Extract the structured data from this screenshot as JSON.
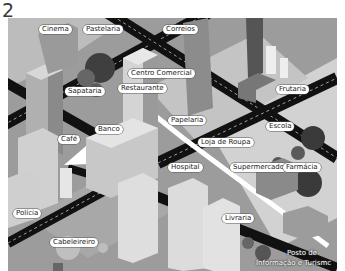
{
  "figure": {
    "number": "2"
  },
  "map": {
    "style": "isometric city illustration, grayscale",
    "colors": {
      "ground": "#9a9a9a",
      "light_block": "#cfcfcf",
      "road": "#111111",
      "route_arrow": "#ffffff"
    },
    "labels": [
      {
        "id": "cinema",
        "text": "Cinema"
      },
      {
        "id": "pastelaria",
        "text": "Pastelaria"
      },
      {
        "id": "correios",
        "text": "Correios"
      },
      {
        "id": "centro-comercial",
        "text": "Centro Comercial"
      },
      {
        "id": "sapataria",
        "text": "Sapataria"
      },
      {
        "id": "restaurante",
        "text": "Restaurante"
      },
      {
        "id": "frutaria",
        "text": "Frutaria"
      },
      {
        "id": "papelaria",
        "text": "Papelaria"
      },
      {
        "id": "cafe",
        "text": "Café"
      },
      {
        "id": "banco",
        "text": "Banco"
      },
      {
        "id": "loja-de-roupa",
        "text": "Loja de Roupa"
      },
      {
        "id": "escola",
        "text": "Escola"
      },
      {
        "id": "hospital",
        "text": "Hospital"
      },
      {
        "id": "supermercado",
        "text": "Supermercado"
      },
      {
        "id": "farmacia",
        "text": "Farmácia"
      },
      {
        "id": "livraria",
        "text": "Livraria"
      },
      {
        "id": "policia",
        "text": "Polícia"
      },
      {
        "id": "cabeleireiro",
        "text": "Cabeleireiro"
      },
      {
        "id": "posto-turismo-1",
        "text": "Posto de"
      },
      {
        "id": "posto-turismo-2",
        "text": "Informação e Turismc"
      }
    ]
  }
}
